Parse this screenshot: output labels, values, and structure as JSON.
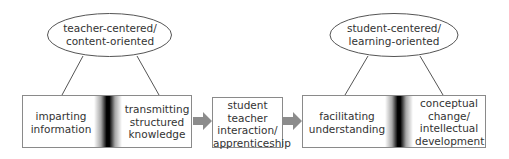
{
  "ovals": {
    "left": {
      "label_line1": "teacher-centered/",
      "label_line2": "content-oriented"
    },
    "right": {
      "label_line1": "student-centered/",
      "label_line2": "learning-oriented"
    }
  },
  "boxes": {
    "left": {
      "left_text": [
        "imparting",
        "information"
      ],
      "right_text": [
        "transmitting",
        "structured",
        "knowledge"
      ]
    },
    "middle": {
      "text": [
        "student",
        "teacher",
        "interaction/",
        "apprenticeship"
      ]
    },
    "right": {
      "left_text": [
        "facilitating",
        "understanding"
      ],
      "right_text": [
        "conceptual",
        "change/",
        "intellectual",
        "development"
      ]
    }
  },
  "colors": {
    "line": "#555555",
    "box_border": "#8a8a8a",
    "arrow": "#8c8c8c",
    "band": "#000000"
  }
}
